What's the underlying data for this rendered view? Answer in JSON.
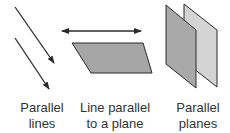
{
  "diagram": {
    "colors": {
      "stroke": "#2a2a2a",
      "plane_fill": "#a6a6a6",
      "front_plane_fill": "#a9a9a9",
      "back_plane_fill": "#d4d4d4",
      "text": "#333333"
    },
    "panels": [
      {
        "id": "parallel-lines",
        "label_line1": "Parallel",
        "label_line2": "lines"
      },
      {
        "id": "line-parallel-to-plane",
        "label_line1": "Line parallel",
        "label_line2": "to a plane"
      },
      {
        "id": "parallel-planes",
        "label_line1": "Parallel",
        "label_line2": "planes"
      }
    ]
  }
}
